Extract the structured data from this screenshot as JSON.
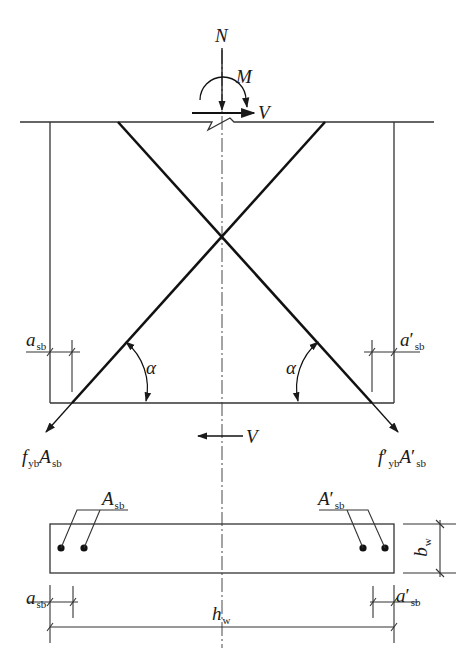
{
  "diagram": {
    "type": "structural force diagram",
    "line_color": "#1a1a1a",
    "loads": {
      "axial": {
        "symbol": "N"
      },
      "moment": {
        "symbol": "M"
      },
      "shear_top": {
        "symbol": "V",
        "direction": "right"
      },
      "shear_bottom": {
        "symbol": "V",
        "direction": "left"
      }
    },
    "elevation": {
      "angle_left": {
        "symbol": "α"
      },
      "angle_right": {
        "symbol": "α"
      },
      "cover_left": {
        "main": "a",
        "sub": "sb",
        "prime": ""
      },
      "cover_right": {
        "main": "a",
        "sub": "sb",
        "prime": "′"
      },
      "force_left": {
        "f_main": "f",
        "f_sub": "yb",
        "a_main": "A",
        "a_sub": "sb",
        "prime": ""
      },
      "force_right": {
        "f_main": "f",
        "f_sub": "yb",
        "a_main": "A",
        "a_sub": "sb",
        "prime": "′"
      }
    },
    "section": {
      "bars_left": {
        "main": "A",
        "sub": "sb",
        "prime": ""
      },
      "bars_right": {
        "main": "A",
        "sub": "sb",
        "prime": "′"
      },
      "width": {
        "main": "b",
        "sub": "w"
      },
      "length": {
        "main": "h",
        "sub": "w"
      },
      "cover_left": {
        "main": "a",
        "sub": "sb",
        "prime": ""
      },
      "cover_right": {
        "main": "a",
        "sub": "sb",
        "prime": "′"
      }
    }
  }
}
